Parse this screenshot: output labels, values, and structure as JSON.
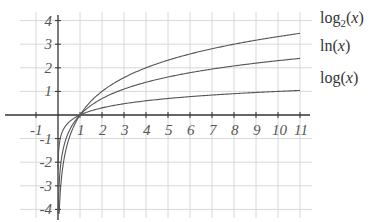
{
  "chart_data": {
    "type": "line",
    "title": "",
    "xlabel": "",
    "ylabel": "",
    "xlim": [
      -1.5,
      11.2
    ],
    "ylim": [
      -4.2,
      4.3
    ],
    "grid": true,
    "legend_position": "inline-right",
    "x_ticks": [
      "-1",
      "1",
      "2",
      "3",
      "4",
      "5",
      "6",
      "7",
      "8",
      "9",
      "10",
      "11"
    ],
    "y_ticks": [
      "4",
      "3",
      "2",
      "1",
      "-1",
      "-2",
      "-3",
      "-4"
    ],
    "series": [
      {
        "name": "log₂(x)",
        "label_base": "log",
        "label_sub": "2",
        "label_arg": "(x)",
        "base": 2
      },
      {
        "name": "ln(x)",
        "label_base": "ln",
        "label_sub": "",
        "label_arg": "(x)",
        "base": 2.718281828
      },
      {
        "name": "log(x)",
        "label_base": "log",
        "label_sub": "",
        "label_arg": "(x)",
        "base": 10
      }
    ],
    "colors": {
      "curve": "#555555",
      "grid": "#d8d8d8",
      "axis": "#333333",
      "text": "#555555"
    }
  }
}
